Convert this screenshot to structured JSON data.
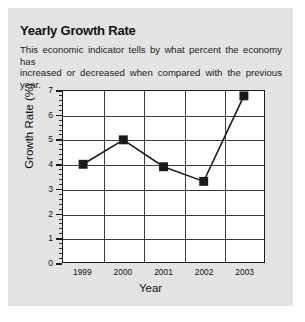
{
  "card": {
    "background": "#e3e3e3"
  },
  "header": {
    "title": "Yearly Growth Rate",
    "description_line1": "This economic indicator tells by what percent the economy has",
    "description_line2": "increased or decreased when compared with the previous year."
  },
  "chart_data": {
    "type": "line",
    "title": "Yearly Growth Rate",
    "xlabel": "Year",
    "ylabel": "Growth Rate (%)",
    "categories": [
      "1999",
      "2000",
      "2001",
      "2002",
      "2003"
    ],
    "values": [
      4.0,
      5.0,
      3.9,
      3.3,
      6.8
    ],
    "ylim": [
      0,
      7
    ],
    "ytick_labels": [
      "0",
      "1",
      "2",
      "3",
      "4",
      "5",
      "6",
      "7"
    ],
    "yticks": [
      0,
      1,
      2,
      3,
      4,
      5,
      6,
      7
    ],
    "minor_ticks_per_interval": 4,
    "grid": true,
    "legend": "none",
    "marker": "square",
    "line_color": "#1a1a1a",
    "marker_color": "#1a1a1a",
    "plot_background": "#ffffff"
  }
}
